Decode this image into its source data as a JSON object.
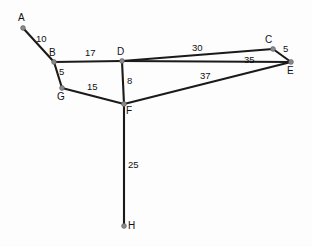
{
  "figure": {
    "title": "",
    "background_color": "#fdfdfd",
    "edge_color": "#1a1a1a",
    "node_color": "#8a8a8a",
    "text_color": "#111111",
    "width": 312,
    "height": 247
  },
  "chart_data": {
    "type": "diagram",
    "subtype": "weighted-graph",
    "title": "",
    "xlabel": "",
    "ylabel": "",
    "grid": false,
    "legend": "none",
    "nodes": [
      {
        "id": "A",
        "label": "A",
        "x": 23,
        "y": 28,
        "label_x": 18,
        "label_y": 13
      },
      {
        "id": "B",
        "label": "B",
        "x": 54,
        "y": 62,
        "label_x": 49,
        "label_y": 48
      },
      {
        "id": "C",
        "label": "C",
        "x": 273,
        "y": 49,
        "label_x": 265,
        "label_y": 35
      },
      {
        "id": "D",
        "label": "D",
        "x": 122,
        "y": 61,
        "label_x": 117,
        "label_y": 47
      },
      {
        "id": "E",
        "label": "E",
        "x": 291,
        "y": 62,
        "label_x": 287,
        "label_y": 66
      },
      {
        "id": "F",
        "label": "F",
        "x": 124,
        "y": 104,
        "label_x": 126,
        "label_y": 106
      },
      {
        "id": "G",
        "label": "G",
        "x": 62,
        "y": 88,
        "label_x": 57,
        "label_y": 92
      },
      {
        "id": "H",
        "label": "H",
        "x": 124,
        "y": 226,
        "label_x": 128,
        "label_y": 221
      }
    ],
    "edges": [
      {
        "from": "A",
        "to": "B",
        "weight": 10,
        "label": "10",
        "label_x": 36,
        "label_y": 34
      },
      {
        "from": "B",
        "to": "D",
        "weight": 17,
        "label": "17",
        "label_x": 85,
        "label_y": 48
      },
      {
        "from": "B",
        "to": "G",
        "weight": 5,
        "label": "5",
        "label_x": 59,
        "label_y": 67
      },
      {
        "from": "G",
        "to": "F",
        "weight": 15,
        "label": "15",
        "label_x": 87,
        "label_y": 82
      },
      {
        "from": "D",
        "to": "F",
        "weight": 8,
        "label": "8",
        "label_x": 127,
        "label_y": 76
      },
      {
        "from": "D",
        "to": "C",
        "weight": 30,
        "label": "30",
        "label_x": 192,
        "label_y": 43
      },
      {
        "from": "D",
        "to": "E",
        "weight": 35,
        "label": "35",
        "label_x": 244,
        "label_y": 55
      },
      {
        "from": "C",
        "to": "E",
        "weight": 5,
        "label": "5",
        "label_x": 283,
        "label_y": 44
      },
      {
        "from": "F",
        "to": "E",
        "weight": 37,
        "label": "37",
        "label_x": 200,
        "label_y": 71
      },
      {
        "from": "F",
        "to": "H",
        "weight": 25,
        "label": "25",
        "label_x": 128,
        "label_y": 160
      }
    ]
  }
}
